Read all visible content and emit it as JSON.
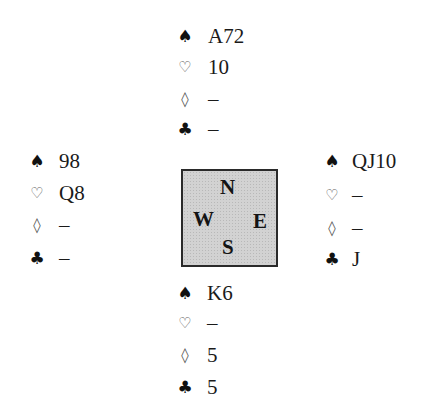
{
  "diagram": {
    "type": "bridge-deal",
    "suit_symbols": {
      "spades": "♠",
      "hearts": "♡",
      "diamonds": "◊",
      "clubs": "♣"
    },
    "compass": {
      "north": "N",
      "west": "W",
      "east": "E",
      "south": "S",
      "fill_color": "#d2d2d2",
      "border_color": "#2a2a2a"
    },
    "hands": {
      "north": {
        "spades": "A72",
        "hearts": "10",
        "diamonds": "–",
        "clubs": "–"
      },
      "west": {
        "spades": "98",
        "hearts": "Q8",
        "diamonds": "–",
        "clubs": "–"
      },
      "east": {
        "spades": "QJ10",
        "hearts": "–",
        "diamonds": "–",
        "clubs": "J"
      },
      "south": {
        "spades": "K6",
        "hearts": "–",
        "diamonds": "5",
        "clubs": "5"
      }
    }
  }
}
